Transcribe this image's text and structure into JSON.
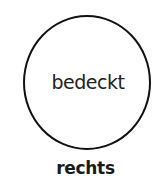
{
  "diagram": {
    "circle": {
      "label": "bedeckt"
    },
    "caption": "rechts"
  },
  "colors": {
    "stroke": "#111111",
    "background": "#ffffff"
  }
}
